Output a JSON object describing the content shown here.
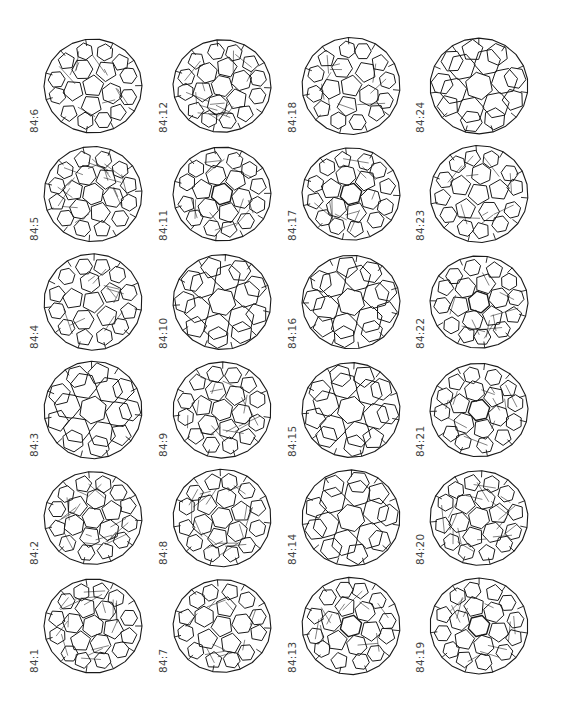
{
  "figure": {
    "layout": {
      "columns": 4,
      "rows": 6,
      "row_order": "top-to-bottom descending"
    },
    "isomers": [
      {
        "label": "84:6",
        "col": 0,
        "row": 0,
        "style": "pent-front",
        "seed": 6
      },
      {
        "label": "84:5",
        "col": 0,
        "row": 1,
        "style": "dense",
        "seed": 5
      },
      {
        "label": "84:4",
        "col": 0,
        "row": 2,
        "style": "pent-front",
        "seed": 4
      },
      {
        "label": "84:3",
        "col": 0,
        "row": 3,
        "style": "open",
        "seed": 3
      },
      {
        "label": "84:2",
        "col": 0,
        "row": 4,
        "style": "dense",
        "seed": 2
      },
      {
        "label": "84:1",
        "col": 0,
        "row": 5,
        "style": "dense",
        "seed": 1
      },
      {
        "label": "84:12",
        "col": 1,
        "row": 0,
        "style": "dense",
        "seed": 12
      },
      {
        "label": "84:11",
        "col": 1,
        "row": 1,
        "style": "hex-front",
        "seed": 11
      },
      {
        "label": "84:10",
        "col": 1,
        "row": 2,
        "style": "open",
        "seed": 10
      },
      {
        "label": "84:9",
        "col": 1,
        "row": 3,
        "style": "dense",
        "seed": 9
      },
      {
        "label": "84:8",
        "col": 1,
        "row": 4,
        "style": "dense",
        "seed": 8
      },
      {
        "label": "84:7",
        "col": 1,
        "row": 5,
        "style": "pent-front",
        "seed": 7
      },
      {
        "label": "84:18",
        "col": 2,
        "row": 0,
        "style": "pent-front",
        "seed": 18
      },
      {
        "label": "84:17",
        "col": 2,
        "row": 1,
        "style": "hex-front",
        "seed": 17
      },
      {
        "label": "84:16",
        "col": 2,
        "row": 2,
        "style": "open",
        "seed": 16
      },
      {
        "label": "84:15",
        "col": 2,
        "row": 3,
        "style": "open",
        "seed": 15
      },
      {
        "label": "84:14",
        "col": 2,
        "row": 4,
        "style": "open",
        "seed": 14
      },
      {
        "label": "84:13",
        "col": 2,
        "row": 5,
        "style": "hex-front",
        "seed": 13
      },
      {
        "label": "84:24",
        "col": 3,
        "row": 0,
        "style": "open",
        "seed": 24
      },
      {
        "label": "84:23",
        "col": 3,
        "row": 1,
        "style": "pent-front",
        "seed": 23
      },
      {
        "label": "84:22",
        "col": 3,
        "row": 2,
        "style": "hex-front",
        "seed": 22
      },
      {
        "label": "84:21",
        "col": 3,
        "row": 3,
        "style": "hex-front",
        "seed": 21
      },
      {
        "label": "84:20",
        "col": 3,
        "row": 4,
        "style": "dense",
        "seed": 20
      },
      {
        "label": "84:19",
        "col": 3,
        "row": 5,
        "style": "hex-front",
        "seed": 19
      }
    ],
    "colors": {
      "line": "#1a1a1a",
      "label": "#444444",
      "background": "#ffffff"
    }
  }
}
